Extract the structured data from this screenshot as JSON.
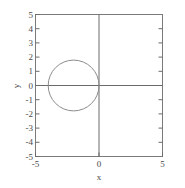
{
  "chart_data": {
    "type": "line",
    "title": "",
    "xlabel": "x",
    "ylabel": "y",
    "xlim": [
      -5,
      5
    ],
    "ylim": [
      -5,
      5
    ],
    "grid": false,
    "legend": null,
    "x_tick_labels": [
      "-5",
      "0",
      "5"
    ],
    "x_tick_values": [
      -5,
      0,
      5
    ],
    "y_tick_labels": [
      "5",
      "4",
      "3",
      "2",
      "1",
      "0",
      "-1",
      "-2",
      "-3",
      "-4",
      "-5"
    ],
    "y_tick_values": [
      5,
      4,
      3,
      2,
      1,
      0,
      -1,
      -2,
      -3,
      -4,
      -5
    ],
    "axis_lines": {
      "x_axis_at_y": 0,
      "y_axis_at_x": 0
    },
    "series": [
      {
        "name": "circle",
        "shape": "circle",
        "center": [
          -2,
          0
        ],
        "radius": 2,
        "color": "#8c8c8c",
        "linewidth": 1,
        "fill": "none"
      }
    ],
    "colors": {
      "line": "#8c8c8c",
      "axis": "#6b6b6b",
      "frame": "#7a7a7a",
      "text": "#4a4a4a",
      "background": "#ffffff"
    }
  }
}
